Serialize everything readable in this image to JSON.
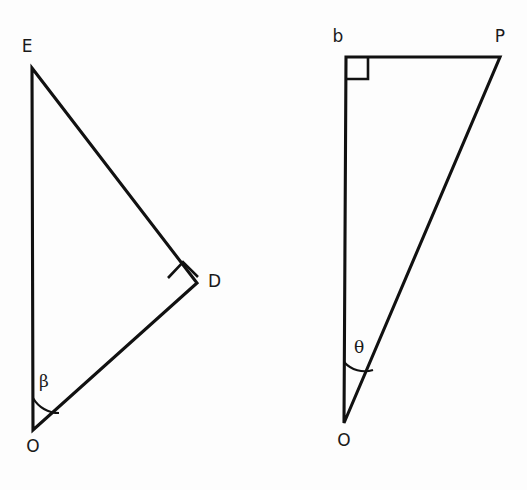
{
  "figure": {
    "background_color": "#fdfdfd",
    "stroke_color": "#111111",
    "text_color": "#1a1a1a"
  },
  "triangles": [
    {
      "id": "left-triangle",
      "name": "triangle-EDO",
      "vertices": [
        {
          "key": "E",
          "label": "E",
          "x": 32,
          "y": 68,
          "label_x": 27,
          "label_y": 52
        },
        {
          "key": "D",
          "label": "D",
          "x": 197,
          "y": 283,
          "label_x": 208,
          "label_y": 287
        },
        {
          "key": "O",
          "label": "O",
          "x": 33,
          "y": 430,
          "label_x": 27,
          "label_y": 452
        }
      ],
      "path": "M 32 68 L 197 283 L 33 430 Z",
      "right_angle": {
        "at": "D",
        "name": "right-angle-marker-D",
        "style": "diamond",
        "path": "M 168 278 L 183 262 L 198 277 L 183 293 Z",
        "marker_path": "M 168 278 L 183 262 L 198 277"
      },
      "angle": {
        "at": "O",
        "symbol": "β",
        "name": "angle-beta",
        "label_x": 42,
        "label_y": 387,
        "arc_path": "M 33 398 A 30 30 0 0 0 59 413",
        "value_hint": "angle at O between OE and OD"
      }
    },
    {
      "id": "right-triangle",
      "name": "triangle-bPO",
      "vertices": [
        {
          "key": "b",
          "label": "b",
          "x": 346,
          "y": 57,
          "label_x": 334,
          "label_y": 42
        },
        {
          "key": "P",
          "label": "P",
          "x": 500,
          "y": 57,
          "label_x": 494,
          "label_y": 42
        },
        {
          "key": "O",
          "label": "O",
          "x": 344,
          "y": 423,
          "label_x": 338,
          "label_y": 446
        }
      ],
      "path": "M 346 57 L 500 57 L 344 423 Z",
      "right_angle": {
        "at": "b",
        "name": "right-angle-marker-b",
        "style": "square",
        "path": "M 346 79 L 368 79 L 368 57",
        "marker_path": "M 346 79 L 368 79 L 368 57"
      },
      "angle": {
        "at": "O",
        "symbol": "θ",
        "name": "angle-theta",
        "label_x": 356,
        "label_y": 353,
        "arc_path": "M 344 362 A 28 28 0 0 0 373 370",
        "value_hint": "angle at O between Ob and OP"
      }
    }
  ]
}
